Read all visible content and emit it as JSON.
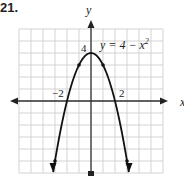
{
  "problem": {
    "number": "21."
  },
  "chart_data": {
    "type": "line",
    "title": "",
    "equation_label": "y = 4 − x",
    "equation_exponent": "2",
    "xlabel": "x",
    "ylabel": "y",
    "xlim": [
      -6,
      6
    ],
    "ylim": [
      -6,
      6
    ],
    "grid": true,
    "tick_labels": {
      "x": [
        "−2",
        "2"
      ],
      "y": [
        "4"
      ]
    },
    "series": [
      {
        "name": "y = 4 - x^2",
        "x": [
          -3,
          -2,
          -1,
          0,
          1,
          2,
          3
        ],
        "y": [
          -5,
          0,
          3,
          4,
          3,
          0,
          -5
        ]
      }
    ],
    "marked_points": [
      [
        -3,
        -5
      ],
      [
        -1,
        3
      ],
      [
        1,
        3
      ],
      [
        3,
        -5
      ]
    ],
    "colors": {
      "grid": "#c8c8c8",
      "axis": "#333333",
      "curve": "#111111"
    }
  }
}
